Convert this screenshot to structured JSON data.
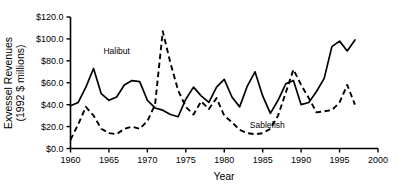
{
  "chart_data": {
    "type": "line",
    "title": "",
    "xlabel": "Year",
    "ylabel": "Exvessel Revenues (1992 $ millions)",
    "ylabel_line1": "Exvessel Revenues",
    "ylabel_line2": "(1992 $ millions)",
    "xlim": [
      1960,
      2000
    ],
    "ylim": [
      0.0,
      120.0
    ],
    "grid": false,
    "legend_position": "inline-annotations",
    "xticks": [
      1960,
      1965,
      1970,
      1975,
      1980,
      1985,
      1990,
      1995,
      2000
    ],
    "xtick_labels": [
      "1960",
      "1965",
      "1970",
      "1975",
      "1980",
      "1985",
      "1990",
      "1995",
      "2000"
    ],
    "yticks": [
      0.0,
      20.0,
      40.0,
      60.0,
      80.0,
      100.0,
      120.0
    ],
    "ytick_labels": [
      "$0.0",
      "$20.0",
      "$40.0",
      "$60.0",
      "$80.0",
      "$100.0",
      "$120.0"
    ],
    "annotations": [
      {
        "text": "Halibut",
        "x": 1966.0,
        "y": 86.0
      },
      {
        "text": "Sablefish",
        "x": 1985.6,
        "y": 18.5
      }
    ],
    "series": [
      {
        "name": "Halibut",
        "style": "solid",
        "color": "#000000",
        "x": [
          1960,
          1961,
          1962,
          1963,
          1964,
          1965,
          1966,
          1967,
          1968,
          1969,
          1970,
          1971,
          1972,
          1973,
          1974,
          1975,
          1976,
          1977,
          1978,
          1979,
          1980,
          1981,
          1982,
          1983,
          1984,
          1985,
          1986,
          1987,
          1988,
          1989,
          1990,
          1991,
          1992,
          1993,
          1994,
          1995,
          1996,
          1997
        ],
        "values": [
          39.0,
          42.0,
          56.0,
          73.0,
          50.0,
          44.0,
          47.0,
          58.0,
          62.0,
          61.0,
          44.0,
          37.0,
          35.0,
          31.0,
          29.0,
          45.0,
          56.0,
          48.0,
          42.0,
          56.0,
          63.0,
          47.0,
          38.0,
          57.0,
          70.0,
          48.0,
          32.0,
          44.0,
          59.0,
          62.0,
          40.0,
          42.0,
          52.0,
          64.0,
          93.0,
          98.0,
          89.0,
          99.0
        ]
      },
      {
        "name": "Sablefish",
        "style": "dashed",
        "color": "#000000",
        "x": [
          1960,
          1961,
          1962,
          1963,
          1964,
          1965,
          1966,
          1967,
          1968,
          1969,
          1970,
          1971,
          1972,
          1973,
          1974,
          1975,
          1976,
          1977,
          1978,
          1979,
          1980,
          1981,
          1982,
          1983,
          1984,
          1985,
          1986,
          1987,
          1988,
          1989,
          1990,
          1991,
          1992,
          1993,
          1994,
          1995,
          1996,
          1997
        ],
        "values": [
          8.0,
          22.0,
          38.0,
          30.0,
          18.0,
          14.0,
          13.0,
          18.0,
          20.0,
          18.0,
          25.0,
          40.0,
          107.0,
          78.0,
          53.0,
          38.0,
          31.0,
          43.0,
          36.0,
          46.0,
          30.0,
          24.0,
          17.0,
          14.0,
          13.0,
          14.0,
          18.0,
          30.0,
          51.0,
          72.0,
          58.0,
          46.0,
          33.0,
          34.0,
          35.0,
          42.0,
          58.0,
          40.0
        ]
      }
    ]
  }
}
